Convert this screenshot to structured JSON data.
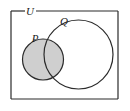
{
  "figure": {
    "type": "venn-diagram",
    "background_color": "#ffffff",
    "stroke_color": "#2b2b2b",
    "shade_color": "#cfcfcf"
  },
  "universal_set": {
    "label": "U",
    "shape": "rectangle",
    "x": 11,
    "y": 11,
    "width": 107,
    "height": 88,
    "label_x": 30,
    "label_y": 11,
    "label_gap_start": 25,
    "label_gap_end": 36
  },
  "sets": [
    {
      "name": "P",
      "label": "P",
      "shape": "circle",
      "cx": 43,
      "cy": 59.5,
      "r": 20.5,
      "shaded": true,
      "label_x": 35,
      "label_y": 42
    },
    {
      "name": "Q",
      "label": "Q",
      "shape": "circle",
      "cx": 78.5,
      "cy": 54.5,
      "r": 34.5,
      "shaded": false,
      "label_x": 64,
      "label_y": 25
    }
  ]
}
